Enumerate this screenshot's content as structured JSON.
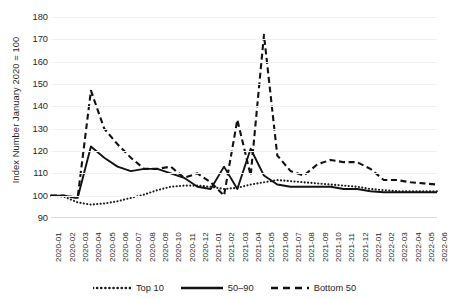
{
  "chart_data": {
    "type": "line",
    "title": "",
    "xlabel": "",
    "ylabel": "Index Number January 2020 = 100",
    "ylim": [
      90,
      180
    ],
    "ytick_step": 10,
    "yticks": [
      90,
      100,
      110,
      120,
      130,
      140,
      150,
      160,
      170,
      180
    ],
    "grid": "horizontal",
    "legend_position": "bottom",
    "categories": [
      "2020-01",
      "2020-02",
      "2020-03",
      "2020-04",
      "2020-05",
      "2020-06",
      "2020-07",
      "2020-08",
      "2020-09",
      "2020-10",
      "2020-11",
      "2020-12",
      "2021-01",
      "2021-02",
      "2021-03",
      "2021-04",
      "2021-05",
      "2021-06",
      "2021-07",
      "2021-08",
      "2021-09",
      "2021-10",
      "2021-11",
      "2021-12",
      "2022-01",
      "2022-02",
      "2022-03",
      "2022-04",
      "2022-05",
      "2022-06"
    ],
    "series": [
      {
        "name": "Top 10",
        "style": "dotted",
        "color": "#1a1a1a",
        "values": [
          100,
          99.5,
          97,
          96,
          96.5,
          97.5,
          99,
          100.5,
          102.5,
          104,
          104.5,
          104.5,
          104,
          103,
          103.5,
          105,
          106,
          107,
          106.5,
          106,
          105.5,
          105,
          104.5,
          104,
          103,
          102.5,
          102,
          102,
          102,
          102
        ]
      },
      {
        "name": "50–90",
        "style": "solid",
        "color": "#121212",
        "values": [
          100,
          100,
          99,
          122,
          117,
          113,
          111,
          112,
          112,
          110,
          108,
          104,
          103,
          113,
          103,
          121,
          109,
          105,
          104,
          104,
          104,
          104,
          103,
          103,
          102,
          101.5,
          101.5,
          101.5,
          101.5,
          101.5
        ]
      },
      {
        "name": "Bottom 50",
        "style": "dashed",
        "color": "#111111",
        "values": [
          100,
          100,
          99,
          147,
          130,
          123,
          117,
          112,
          112,
          113,
          108,
          110,
          106,
          100,
          134,
          109,
          172,
          118,
          111,
          109,
          114,
          116,
          115,
          115,
          112,
          107,
          107,
          106,
          105.5,
          105
        ]
      }
    ]
  },
  "legend": {
    "items": [
      {
        "label": "Top 10"
      },
      {
        "label": "50–90"
      },
      {
        "label": "Bottom 50"
      }
    ]
  }
}
